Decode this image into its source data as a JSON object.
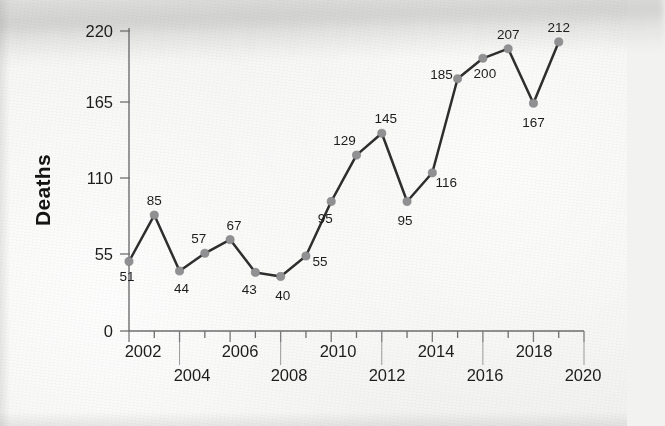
{
  "chart_data": {
    "type": "line",
    "title": "",
    "xlabel": "",
    "ylabel": "Deaths",
    "xlim": [
      2002,
      2020
    ],
    "ylim": [
      0,
      220
    ],
    "grid": false,
    "legend": "none",
    "y_ticks": [
      0,
      55,
      110,
      165,
      220
    ],
    "x_ticks": [
      2002,
      2003,
      2004,
      2005,
      2006,
      2007,
      2008,
      2009,
      2010,
      2011,
      2012,
      2013,
      2014,
      2015,
      2016,
      2017,
      2018,
      2019,
      2020
    ],
    "x_tick_labels": [
      "2002",
      "2004",
      "2006",
      "2008",
      "2010",
      "2012",
      "2014",
      "2016",
      "2018",
      "2020"
    ],
    "x": [
      2002,
      2003,
      2004,
      2005,
      2006,
      2007,
      2008,
      2009,
      2010,
      2011,
      2012,
      2013,
      2014,
      2015,
      2016,
      2017,
      2018,
      2019
    ],
    "values": [
      51,
      85,
      44,
      57,
      67,
      43,
      40,
      55,
      95,
      129,
      145,
      95,
      116,
      185,
      200,
      207,
      167,
      212
    ],
    "point_labels": [
      "51",
      "85",
      "44",
      "57",
      "67",
      "43",
      "40",
      "55",
      "95",
      "129",
      "145",
      "95",
      "116",
      "185",
      "200",
      "207",
      "167",
      "212"
    ],
    "series": [
      {
        "name": "Deaths",
        "values": [
          51,
          85,
          44,
          57,
          67,
          43,
          40,
          55,
          95,
          129,
          145,
          95,
          116,
          185,
          200,
          207,
          167,
          212
        ]
      }
    ],
    "colors": {
      "line": "#2e2e2e",
      "marker": "#909092",
      "axis": "#6e6e70",
      "text": "#1d1d1d",
      "background": "#f5f5f3"
    }
  },
  "axes": {
    "y_title": "Deaths",
    "y_tick_labels": [
      "0",
      "55",
      "110",
      "165",
      "220"
    ],
    "x_row_top": [
      "2002",
      "2006",
      "2010",
      "2014",
      "2018"
    ],
    "x_row_bottom": [
      "2004",
      "2008",
      "2012",
      "2016",
      "2020"
    ]
  },
  "point_label_text": {
    "p0": "51",
    "p1": "85",
    "p2": "44",
    "p3": "57",
    "p4": "67",
    "p5": "43",
    "p6": "40",
    "p7": "55",
    "p8": "95",
    "p9": "129",
    "p10": "145",
    "p11": "95",
    "p12": "116",
    "p13": "185",
    "p14": "200",
    "p15": "207",
    "p16": "167",
    "p17": "212"
  }
}
